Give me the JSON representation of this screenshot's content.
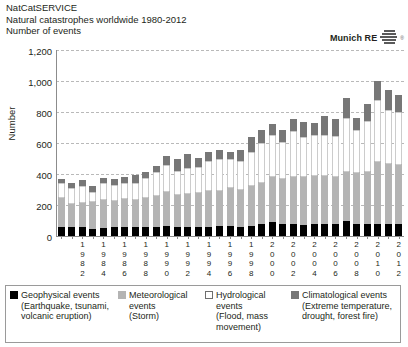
{
  "header": {
    "line1": "NatCatSERVICE",
    "line2": "Natural catastrophes worldwide 1980-2012",
    "line3": "Number of events"
  },
  "brand": {
    "name": "Munich RE",
    "mark": "munich-re-stacked-bars-logo",
    "registered": "®"
  },
  "chart_data": {
    "type": "bar",
    "stacked": true,
    "title": "Natural catastrophes worldwide 1980-2012",
    "subtitle": "Number of events",
    "xlabel": "",
    "ylabel": "Number",
    "ylim": [
      0,
      1200
    ],
    "yticks": [
      0,
      200,
      400,
      600,
      800,
      1000,
      1200
    ],
    "ytick_labels": [
      "0",
      "200",
      "400",
      "600",
      "800",
      "1,000",
      "1,200"
    ],
    "grid": true,
    "legend_position": "bottom",
    "categories": [
      "1980",
      "1981",
      "1982",
      "1983",
      "1984",
      "1985",
      "1986",
      "1987",
      "1988",
      "1989",
      "1990",
      "1991",
      "1992",
      "1993",
      "1994",
      "1995",
      "1996",
      "1997",
      "1998",
      "1999",
      "2000",
      "2001",
      "2002",
      "2003",
      "2004",
      "2005",
      "2006",
      "2007",
      "2008",
      "2009",
      "2010",
      "2011",
      "2012"
    ],
    "tick_label_every": 2,
    "tick_label_start": "1982",
    "series": [
      {
        "name": "Geophysical events",
        "color": "#000000",
        "values": [
          60,
          55,
          60,
          45,
          50,
          60,
          55,
          60,
          55,
          55,
          65,
          60,
          60,
          60,
          60,
          65,
          65,
          60,
          65,
          80,
          90,
          75,
          75,
          70,
          80,
          75,
          75,
          95,
          80,
          80,
          75,
          75,
          80
        ]
      },
      {
        "name": "Meteorological events",
        "color": "#b4b4b4",
        "values": [
          185,
          150,
          155,
          175,
          185,
          165,
          185,
          170,
          190,
          200,
          220,
          205,
          210,
          215,
          230,
          225,
          245,
          240,
          255,
          265,
          290,
          290,
          305,
          310,
          310,
          315,
          305,
          320,
          325,
          330,
          400,
          390,
          380
        ]
      },
      {
        "name": "Hydrological events",
        "color": "#ffffff",
        "values": [
          95,
          105,
          105,
          65,
          105,
          105,
          105,
          115,
          130,
          160,
          175,
          155,
          170,
          170,
          195,
          205,
          185,
          185,
          225,
          255,
          275,
          240,
          300,
          260,
          265,
          260,
          265,
          345,
          280,
          330,
          400,
          350,
          340
        ]
      },
      {
        "name": "Climatological events",
        "color": "#777777",
        "values": [
          25,
          30,
          40,
          40,
          35,
          35,
          35,
          50,
          35,
          40,
          55,
          80,
          90,
          60,
          55,
          60,
          45,
          70,
          95,
          85,
          65,
          80,
          75,
          95,
          75,
          125,
          110,
          130,
          75,
          115,
          125,
          125,
          110
        ]
      }
    ],
    "annotations": []
  },
  "legend": [
    {
      "swatch": "geo",
      "title": "Geophysical events",
      "sublines": [
        "(Earthquake, tsunami,",
        "volcanic eruption)"
      ]
    },
    {
      "swatch": "met",
      "title": "Meteorological",
      "sublines": [
        "events",
        "(Storm)"
      ]
    },
    {
      "swatch": "hyd",
      "title": "Hydrological",
      "sublines": [
        "events",
        "(Flood, mass",
        "movement)"
      ]
    },
    {
      "swatch": "cli",
      "title": "Climatological events",
      "sublines": [
        "(Extreme temperature,",
        "drought, forest fire)"
      ]
    }
  ]
}
